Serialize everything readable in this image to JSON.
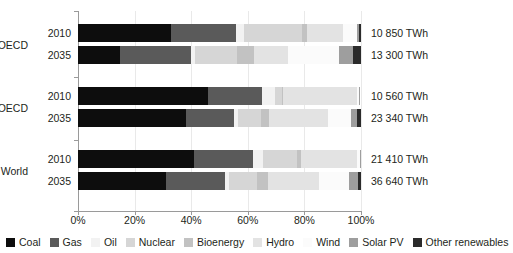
{
  "chart_data": {
    "type": "bar",
    "orientation": "horizontal",
    "stacked": true,
    "normalized": "100%",
    "title": "",
    "xlabel": "",
    "ylabel": "",
    "xlim": [
      0,
      100
    ],
    "xticks": [
      "0%",
      "20%",
      "40%",
      "60%",
      "80%",
      "100%"
    ],
    "xtick_values": [
      0,
      20,
      40,
      60,
      80,
      100
    ],
    "grid": true,
    "legend_position": "bottom",
    "categories": [
      "OECD 2010",
      "OECD 2035",
      "Non-OECD 2010",
      "Non-OECD 2035",
      "World 2010",
      "World 2035"
    ],
    "series": [
      {
        "name": "Coal",
        "color": "#0d0d0d",
        "values": [
          33.0,
          15.0,
          46.0,
          38.0,
          41.0,
          31.0
        ]
      },
      {
        "name": "Gas",
        "color": "#5a5a5a",
        "values": [
          23.0,
          25.0,
          19.0,
          17.0,
          21.0,
          21.0
        ]
      },
      {
        "name": "Oil",
        "color": "#f2f2f2",
        "values": [
          2.5,
          1.2,
          4.5,
          1.5,
          3.5,
          1.3
        ]
      },
      {
        "name": "Nuclear",
        "color": "#d6d6d6",
        "values": [
          20.5,
          15.0,
          2.5,
          8.0,
          12.0,
          10.0
        ]
      },
      {
        "name": "Bioenergy",
        "color": "#c2c2c2",
        "values": [
          2.0,
          6.0,
          0.6,
          3.0,
          1.2,
          4.0
        ]
      },
      {
        "name": "Hydro",
        "color": "#e3e3e3",
        "values": [
          12.5,
          12.0,
          26.0,
          21.0,
          20.0,
          18.0
        ]
      },
      {
        "name": "Wind",
        "color": "#fbfbfb",
        "values": [
          5.2,
          18.0,
          0.7,
          8.0,
          1.0,
          10.5
        ]
      },
      {
        "name": "Solar PV",
        "color": "#9e9e9e",
        "values": [
          0.6,
          5.0,
          0.2,
          2.2,
          0.3,
          3.0
        ]
      },
      {
        "name": "Other renewables",
        "color": "#2b2b2b",
        "values": [
          0.7,
          2.8,
          0.0,
          1.3,
          0.0,
          1.2
        ]
      }
    ],
    "groups": [
      {
        "label": "OECD",
        "bars": [
          {
            "year": "2010",
            "value_label": "10 850 TWh"
          },
          {
            "year": "2035",
            "value_label": "13 300 TWh"
          }
        ]
      },
      {
        "label": "Non-OECD",
        "bars": [
          {
            "year": "2010",
            "value_label": "10 560 TWh"
          },
          {
            "year": "2035",
            "value_label": "23 340 TWh"
          }
        ]
      },
      {
        "label": "World",
        "bars": [
          {
            "year": "2010",
            "value_label": "21 410 TWh"
          },
          {
            "year": "2035",
            "value_label": "36 640 TWh"
          }
        ]
      }
    ],
    "legend": [
      "Coal",
      "Gas",
      "Oil",
      "Nuclear",
      "Bioenergy",
      "Hydro",
      "Wind",
      "Solar PV",
      "Other renewables"
    ],
    "value_labels": [
      "10 850 TWh",
      "13 300 TWh",
      "10 560 TWh",
      "23 340 TWh",
      "21 410 TWh",
      "36 640 TWh"
    ]
  }
}
